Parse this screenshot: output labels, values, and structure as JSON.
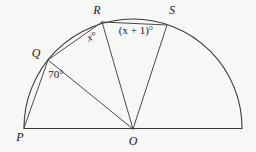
{
  "figure": {
    "background_color": "#f7f7f5",
    "stroke_color": "#3a3a3a",
    "center_label": "O",
    "radius": 109,
    "center": {
      "x": 133,
      "y": 129
    },
    "points": [
      {
        "name": "P",
        "label": "P",
        "x": 24,
        "y": 128,
        "angle_deg": 180,
        "label_x": 20,
        "label_y": 141
      },
      {
        "name": "Q",
        "label": "Q",
        "x": 48,
        "y": 60,
        "angle_deg": 141,
        "label_x": 36,
        "label_y": 57
      },
      {
        "name": "R",
        "label": "R",
        "x": 102,
        "y": 22,
        "angle_deg": 112,
        "label_x": 97,
        "label_y": 14
      },
      {
        "name": "S",
        "label": "S",
        "x": 167,
        "y": 25,
        "angle_deg": 72,
        "label_x": 172,
        "label_y": 14
      },
      {
        "name": "O",
        "label": "O",
        "x": 133,
        "y": 129,
        "angle_deg": 0,
        "label_x": 133,
        "label_y": 145
      }
    ],
    "arc_end_right": {
      "x": 242,
      "y": 128
    },
    "angle_labels": [
      {
        "name": "angle-poq",
        "text": "70°",
        "x": 56,
        "y": 78,
        "italic": false
      },
      {
        "name": "angle-qor",
        "text": "x°",
        "x": 93,
        "y": 40,
        "italic": true,
        "rotate": -22
      },
      {
        "name": "angle-ros",
        "text": "(x + 1)°",
        "x": 136,
        "y": 34,
        "italic": false
      }
    ],
    "segments": [
      {
        "name": "baseline-p-to-right",
        "from": "P",
        "to": "arc-end-right"
      },
      {
        "name": "radius-o-q",
        "from": "O",
        "to": "Q"
      },
      {
        "name": "radius-o-r",
        "from": "O",
        "to": "R"
      },
      {
        "name": "radius-o-s",
        "from": "O",
        "to": "S"
      },
      {
        "name": "chord-p-q",
        "from": "P",
        "to": "Q"
      },
      {
        "name": "chord-q-r",
        "from": "Q",
        "to": "R"
      },
      {
        "name": "chord-r-s",
        "from": "R",
        "to": "S"
      }
    ]
  }
}
